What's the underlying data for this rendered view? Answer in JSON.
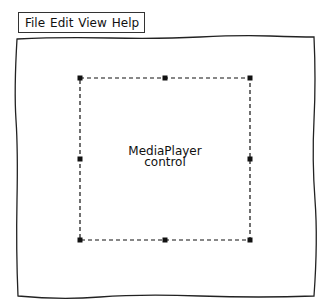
{
  "menubar": {
    "items": [
      {
        "label": "File"
      },
      {
        "label": "Edit"
      },
      {
        "label": "View"
      },
      {
        "label": "Help"
      }
    ]
  },
  "canvas": {
    "control": {
      "line1": "MediaPlayer",
      "line2": "control",
      "selection": "dashed-with-8-handles"
    }
  }
}
